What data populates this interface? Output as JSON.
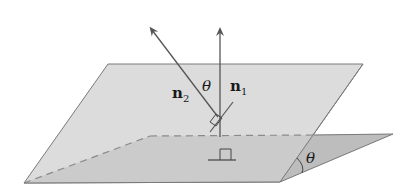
{
  "diagram": {
    "type": "geometry",
    "labels": {
      "normal_1": "n",
      "normal_1_sub": "1",
      "normal_2": "n",
      "normal_2_sub": "2",
      "angle_between_normals": "θ",
      "angle_between_planes": "θ"
    },
    "colors": {
      "upper_plane": "#dcdcdc",
      "lower_plane": "#bdbdbd",
      "edge": "#7a7a7a",
      "vector": "#555555",
      "text": "#1a1a1a"
    },
    "markers": [
      "right-angle-on-upper-plane",
      "right-angle-on-lower-plane"
    ]
  }
}
